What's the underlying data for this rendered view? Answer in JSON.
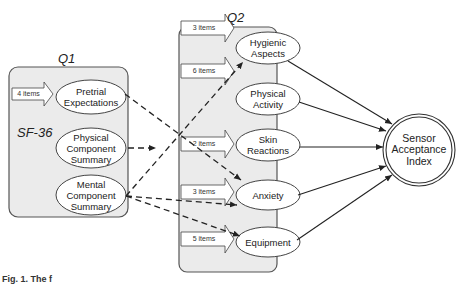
{
  "diagram": {
    "groups": {
      "q1": {
        "title": "Q1",
        "subtitle": "SF-36"
      },
      "q2": {
        "title": "Q2"
      }
    },
    "q1_nodes": [
      {
        "id": "pretrial",
        "label_lines": [
          "Pretrial",
          "Expectations"
        ],
        "items": "4 items"
      },
      {
        "id": "pcs",
        "label_lines": [
          "Physical",
          "Component",
          "Summary"
        ]
      },
      {
        "id": "mcs",
        "label_lines": [
          "Mental",
          "Component",
          "Summary"
        ]
      }
    ],
    "q2_nodes": [
      {
        "id": "hygienic",
        "label_lines": [
          "Hygienic",
          "Aspects"
        ],
        "items": "3 items"
      },
      {
        "id": "physical_activity",
        "label_lines": [
          "Physical",
          "Activity"
        ],
        "items": "6 items"
      },
      {
        "id": "skin",
        "label_lines": [
          "Skin",
          "Reactions"
        ],
        "items": "2 items"
      },
      {
        "id": "anxiety",
        "label_lines": [
          "Anxiety"
        ],
        "items": "3 items"
      },
      {
        "id": "equipment",
        "label_lines": [
          "Equipment"
        ],
        "items": "5 items"
      }
    ],
    "outcome": {
      "label_lines": [
        "Sensor",
        "Acceptance",
        "Index"
      ]
    },
    "caption": "Fig. 1. The f",
    "edges_dashed": [
      [
        "pretrial",
        "anxiety"
      ],
      [
        "pcs",
        "q2_group"
      ],
      [
        "mcs",
        "hygienic"
      ],
      [
        "mcs",
        "anxiety"
      ],
      [
        "mcs",
        "equipment"
      ]
    ],
    "edges_solid": [
      [
        "hygienic",
        "outcome"
      ],
      [
        "physical_activity",
        "outcome"
      ],
      [
        "skin",
        "outcome"
      ],
      [
        "anxiety",
        "outcome"
      ],
      [
        "equipment",
        "outcome"
      ]
    ],
    "colors": {
      "group_fill": "#ebebeb",
      "group_stroke": "#555555",
      "node_fill": "#ffffff",
      "line": "#222222"
    }
  }
}
